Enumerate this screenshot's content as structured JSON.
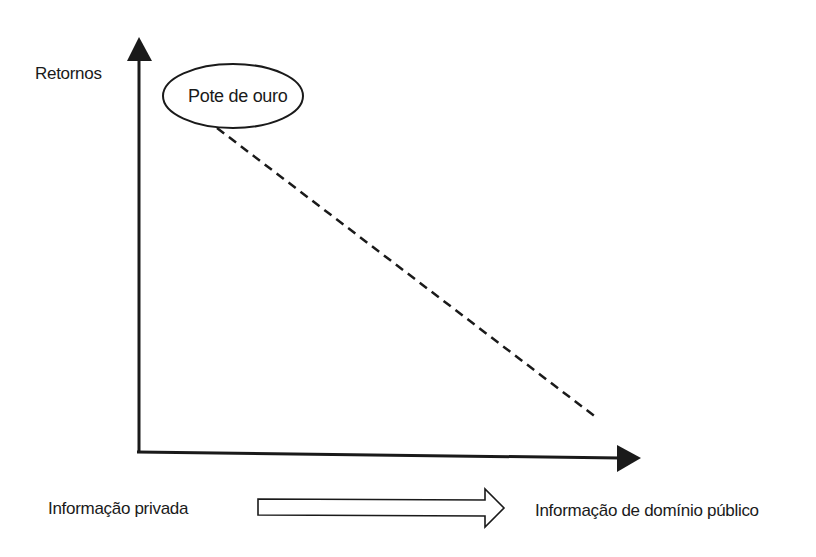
{
  "diagram": {
    "type": "conceptual-axes",
    "y_axis": {
      "label": "Retornos"
    },
    "x_axis": {
      "label": ""
    },
    "highlight": {
      "label": "Pote de ouro",
      "shape": "ellipse"
    },
    "trend_line": {
      "style": "dashed",
      "direction": "descending",
      "from": "Pote de ouro",
      "to": "lower-right"
    },
    "bottom_arrow": {
      "start_label": "Informação privada",
      "end_label": "Informação de domínio público",
      "style": "hollow-block-arrow"
    },
    "colors": {
      "stroke": "#1a1a1a",
      "background": "#ffffff"
    }
  }
}
